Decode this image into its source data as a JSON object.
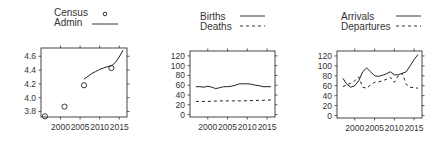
{
  "figure": {
    "background": "#ffffff",
    "line_color": "#222222",
    "axis_color": "#333333"
  },
  "chart_data": [
    {
      "type": "line",
      "title": "",
      "xlabel": "",
      "ylabel": "",
      "legend": [
        {
          "label": "Census",
          "style": "points-open-circle"
        },
        {
          "label": "Admin",
          "style": "solid-line"
        }
      ],
      "legend_position": "top",
      "xlim": [
        1995,
        2017
      ],
      "ylim": [
        3.72,
        4.72
      ],
      "x_ticks": [
        2000,
        2005,
        2010,
        2015
      ],
      "y_ticks": [
        3.8,
        4.0,
        4.2,
        4.4,
        4.6
      ],
      "y_tick_labels": [
        "3.8",
        "4.0",
        "4.2",
        "4.4",
        "4.6"
      ],
      "grid": false,
      "series": [
        {
          "name": "Census",
          "kind": "points",
          "x": [
            1996,
            2001,
            2006,
            2013
          ],
          "y": [
            3.73,
            3.87,
            4.18,
            4.43
          ]
        },
        {
          "name": "Admin",
          "kind": "line",
          "x": [
            2006,
            2007,
            2008,
            2009,
            2010,
            2011,
            2012,
            2013,
            2014,
            2015,
            2016
          ],
          "y": [
            4.27,
            4.31,
            4.35,
            4.38,
            4.41,
            4.43,
            4.45,
            4.46,
            4.51,
            4.59,
            4.69
          ]
        }
      ]
    },
    {
      "type": "line",
      "title": "",
      "xlabel": "",
      "ylabel": "",
      "legend": [
        {
          "label": "Births",
          "style": "solid-line"
        },
        {
          "label": "Deaths",
          "style": "dashed-line"
        }
      ],
      "legend_position": "top",
      "xlim": [
        1995.5,
        2017
      ],
      "ylim": [
        -5,
        130
      ],
      "x_ticks": [
        2000,
        2005,
        2010,
        2015
      ],
      "y_ticks": [
        0,
        20,
        40,
        60,
        80,
        100,
        120
      ],
      "y_tick_labels": [
        "0",
        "20",
        "40",
        "60",
        "80",
        "100",
        "120"
      ],
      "grid": false,
      "series": [
        {
          "name": "Births",
          "kind": "line",
          "x": [
            1997,
            1998,
            1999,
            2000,
            2001,
            2002,
            2003,
            2004,
            2005,
            2006,
            2007,
            2008,
            2009,
            2010,
            2011,
            2012,
            2013,
            2014,
            2015,
            2016
          ],
          "y": [
            57,
            57,
            56,
            58,
            56,
            53,
            55,
            57,
            57,
            58,
            60,
            63,
            63,
            63,
            62,
            60,
            59,
            57,
            57,
            57
          ]
        },
        {
          "name": "Deaths",
          "kind": "dashed",
          "x": [
            1997,
            2000,
            2003,
            2006,
            2009,
            2012,
            2014,
            2016
          ],
          "y": [
            27,
            27,
            28,
            28,
            28,
            29,
            29,
            30
          ]
        }
      ]
    },
    {
      "type": "line",
      "title": "",
      "xlabel": "",
      "ylabel": "",
      "legend": [
        {
          "label": "Arrivals",
          "style": "solid-line"
        },
        {
          "label": "Departures",
          "style": "dashed-line"
        }
      ],
      "legend_position": "top",
      "xlim": [
        1995.5,
        2017
      ],
      "ylim": [
        -5,
        130
      ],
      "x_ticks": [
        2000,
        2005,
        2010,
        2015
      ],
      "y_ticks": [
        0,
        20,
        40,
        60,
        80,
        100,
        120
      ],
      "y_tick_labels": [
        "0",
        "20",
        "40",
        "60",
        "80",
        "100",
        "120"
      ],
      "grid": false,
      "series": [
        {
          "name": "Arrivals",
          "kind": "line",
          "x": [
            1997,
            1998,
            1999,
            2000,
            2001,
            2002,
            2003,
            2004,
            2005,
            2006,
            2007,
            2008,
            2009,
            2010,
            2011,
            2012,
            2013,
            2014,
            2015,
            2016
          ],
          "y": [
            75,
            63,
            57,
            60,
            70,
            88,
            96,
            88,
            80,
            79,
            81,
            84,
            88,
            82,
            82,
            85,
            88,
            100,
            113,
            123
          ]
        },
        {
          "name": "Departures",
          "kind": "dashed",
          "x": [
            1997,
            1998,
            1999,
            2000,
            2001,
            2002,
            2003,
            2004,
            2005,
            2006,
            2007,
            2008,
            2009,
            2010,
            2011,
            2012,
            2013,
            2014,
            2015,
            2016
          ],
          "y": [
            58,
            62,
            65,
            70,
            78,
            57,
            55,
            62,
            67,
            68,
            70,
            73,
            77,
            67,
            80,
            85,
            63,
            57,
            56,
            55
          ]
        }
      ]
    }
  ],
  "panels": [
    {
      "id": "population",
      "legend": [
        "Census",
        "Admin"
      ]
    },
    {
      "id": "natural-change",
      "legend": [
        "Births",
        "Deaths"
      ]
    },
    {
      "id": "migration",
      "legend": [
        "Arrivals",
        "Departures"
      ]
    }
  ]
}
